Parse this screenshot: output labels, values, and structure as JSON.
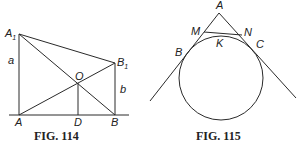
{
  "figures": [
    {
      "id": "fig114",
      "caption": "FIG. 114",
      "points": {
        "A1": {
          "label": "A",
          "sub": "1"
        },
        "B1": {
          "label": "B",
          "sub": "1"
        },
        "A": {
          "label": "A"
        },
        "B": {
          "label": "B"
        },
        "O": {
          "label": "O"
        },
        "D": {
          "label": "D"
        }
      },
      "segments": {
        "a": {
          "label": "a"
        },
        "b": {
          "label": "b"
        }
      }
    },
    {
      "id": "fig115",
      "caption": "FIG. 115",
      "points": {
        "A": {
          "label": "A"
        },
        "M": {
          "label": "M"
        },
        "N": {
          "label": "N"
        },
        "K": {
          "label": "K"
        },
        "B": {
          "label": "B"
        },
        "C": {
          "label": "C"
        }
      }
    }
  ]
}
